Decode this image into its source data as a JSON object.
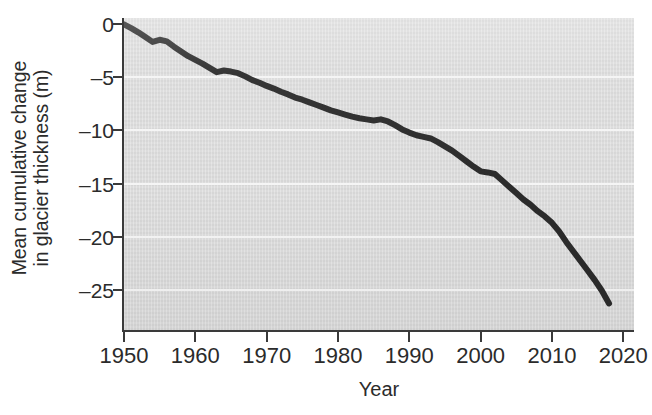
{
  "chart_data": {
    "type": "line",
    "title": "",
    "xlabel": "Year",
    "ylabel": "Mean cumulative change in glacier thickness (m)",
    "ylabel_line1": "Mean cumulative change",
    "ylabel_line2": "in glacier thickness (m)",
    "xlim": [
      1950,
      2021.5
    ],
    "ylim": [
      -28.8,
      0.6
    ],
    "grid": "horizontal",
    "legend": "none",
    "series_color": "#2b2b2b",
    "plot_background": "#dedede",
    "gridline_color": "#f5f5f5",
    "axis_color": "#3a3a3a",
    "xticks": [
      1950,
      1960,
      1970,
      1980,
      1990,
      2000,
      2010,
      2020
    ],
    "xtick_labels": [
      "1950",
      "1960",
      "1970",
      "1980",
      "1990",
      "2000",
      "2010",
      "2020"
    ],
    "yticks": [
      0,
      -5,
      -10,
      -15,
      -20,
      -25
    ],
    "ytick_labels": [
      "0",
      "–5",
      "–10",
      "–15",
      "–20",
      "–25"
    ],
    "x": [
      1950,
      1951,
      1952,
      1953,
      1954,
      1955,
      1956,
      1957,
      1958,
      1959,
      1960,
      1961,
      1962,
      1963,
      1964,
      1965,
      1966,
      1967,
      1968,
      1969,
      1970,
      1971,
      1972,
      1973,
      1974,
      1975,
      1976,
      1977,
      1978,
      1979,
      1980,
      1981,
      1982,
      1983,
      1984,
      1985,
      1986,
      1987,
      1988,
      1989,
      1990,
      1991,
      1992,
      1993,
      1994,
      1995,
      1996,
      1997,
      1998,
      1999,
      2000,
      2001,
      2002,
      2003,
      2004,
      2005,
      2006,
      2007,
      2008,
      2009,
      2010,
      2011,
      2012,
      2013,
      2014,
      2015,
      2016,
      2017,
      2018
    ],
    "values": [
      0.0,
      -0.35,
      -0.75,
      -1.2,
      -1.65,
      -1.45,
      -1.6,
      -2.1,
      -2.55,
      -3.0,
      -3.35,
      -3.7,
      -4.1,
      -4.5,
      -4.35,
      -4.45,
      -4.6,
      -4.9,
      -5.25,
      -5.5,
      -5.8,
      -6.05,
      -6.35,
      -6.6,
      -6.9,
      -7.1,
      -7.35,
      -7.6,
      -7.85,
      -8.1,
      -8.3,
      -8.5,
      -8.7,
      -8.85,
      -8.95,
      -9.05,
      -8.95,
      -9.15,
      -9.5,
      -9.9,
      -10.2,
      -10.45,
      -10.6,
      -10.75,
      -11.1,
      -11.5,
      -11.9,
      -12.4,
      -12.9,
      -13.4,
      -13.85,
      -13.95,
      -14.1,
      -14.7,
      -15.3,
      -15.9,
      -16.5,
      -17.0,
      -17.6,
      -18.1,
      -18.7,
      -19.5,
      -20.5,
      -21.4,
      -22.3,
      -23.2,
      -24.1,
      -25.1,
      -26.3
    ],
    "x_pixel_range": [
      124,
      634
    ],
    "y_pixel_range": [
      18,
      330
    ],
    "series_linewidth": 6
  }
}
